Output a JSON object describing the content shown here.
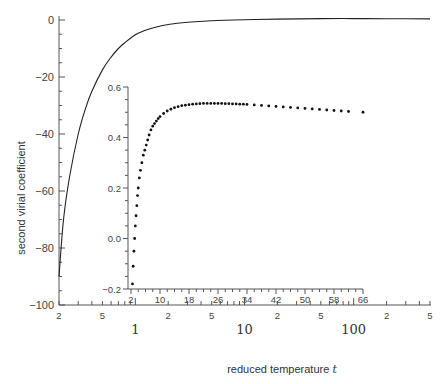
{
  "chart_data": [
    {
      "type": "line",
      "role": "main",
      "title": "",
      "xlabel": "reduced temperature t",
      "ylabel": "second virial coefficient",
      "xscale": "log",
      "xlim": [
        0.2,
        500
      ],
      "ylim": [
        -100,
        0
      ],
      "x_tick_labels": [
        "2",
        "5",
        "1",
        "2",
        "5",
        "10",
        "2",
        "5",
        "100",
        "2",
        "5"
      ],
      "x_tick_values": [
        0.2,
        0.5,
        1,
        2,
        5,
        10,
        20,
        50,
        100,
        200,
        500
      ],
      "y_ticks": [
        0,
        -20,
        -40,
        -60,
        -80,
        -100
      ],
      "grid": false,
      "series": [
        {
          "name": "B*(t)",
          "x": [
            0.2,
            0.22,
            0.25,
            0.3,
            0.35,
            0.4,
            0.5,
            0.6,
            0.7,
            0.8,
            1,
            1.2,
            1.5,
            2,
            3,
            5,
            10,
            20,
            50,
            100,
            200,
            500
          ],
          "values": [
            -90,
            -70,
            -55,
            -40,
            -31,
            -25,
            -17.5,
            -13,
            -10,
            -8,
            -5.2,
            -3.8,
            -2.6,
            -1.6,
            -0.8,
            -0.25,
            0.1,
            0.3,
            0.5,
            0.5,
            0.45,
            0.4
          ]
        }
      ]
    },
    {
      "type": "scatter",
      "role": "inset",
      "title": "",
      "xlabel": "",
      "ylabel": "",
      "xlim": [
        2,
        66
      ],
      "ylim": [
        -0.2,
        0.6
      ],
      "x_ticks": [
        2,
        10,
        18,
        26,
        34,
        42,
        50,
        58,
        66
      ],
      "y_ticks": [
        -0.2,
        0.0,
        0.2,
        0.4,
        0.6
      ],
      "y_tick_labels": [
        "-0.2",
        "0.0",
        "0.2",
        "0.4",
        "0.6"
      ],
      "grid": false,
      "series": [
        {
          "name": "B*(t) detail",
          "x": [
            2.4,
            2.6,
            2.8,
            3.0,
            3.2,
            3.4,
            3.6,
            3.8,
            4.0,
            4.3,
            4.6,
            5.0,
            5.4,
            5.8,
            6.2,
            6.6,
            7.0,
            7.5,
            8,
            8.5,
            9,
            9.5,
            10,
            11,
            12,
            13,
            14,
            15,
            16,
            17,
            18,
            19,
            20,
            21,
            22,
            23,
            24,
            25,
            26,
            27,
            28,
            29,
            30,
            31,
            32,
            33,
            34,
            36,
            38,
            40,
            42,
            44,
            46,
            48,
            50,
            52,
            54,
            56,
            58,
            60,
            62,
            66
          ],
          "values": [
            -0.18,
            -0.11,
            -0.05,
            0.0,
            0.05,
            0.09,
            0.13,
            0.17,
            0.2,
            0.24,
            0.27,
            0.3,
            0.33,
            0.35,
            0.37,
            0.39,
            0.41,
            0.43,
            0.445,
            0.455,
            0.465,
            0.475,
            0.483,
            0.495,
            0.505,
            0.512,
            0.518,
            0.522,
            0.526,
            0.528,
            0.53,
            0.532,
            0.533,
            0.534,
            0.535,
            0.535,
            0.535,
            0.535,
            0.535,
            0.535,
            0.534,
            0.534,
            0.533,
            0.533,
            0.532,
            0.532,
            0.531,
            0.529,
            0.527,
            0.525,
            0.523,
            0.521,
            0.519,
            0.517,
            0.515,
            0.513,
            0.511,
            0.509,
            0.507,
            0.505,
            0.503,
            0.5
          ]
        }
      ]
    }
  ]
}
